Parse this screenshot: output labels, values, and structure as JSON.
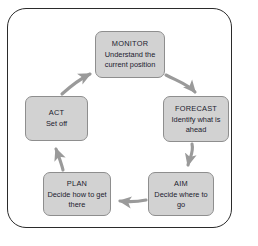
{
  "diagram": {
    "type": "cycle",
    "frame": {
      "visible": true,
      "border_color": "#2b2b2b"
    },
    "style": {
      "node_fill": "#d2d2d2",
      "node_border": "#8e8e8e",
      "text_color": "#1b1b2e",
      "arrow_color": "#9a9a9a",
      "background": "#ffffff"
    },
    "nodes": [
      {
        "id": "monitor",
        "title": "MONITOR",
        "desc": "Understand the current position"
      },
      {
        "id": "forecast",
        "title": "FORECAST",
        "desc": "Identify what is ahead"
      },
      {
        "id": "aim",
        "title": "AIM",
        "desc": "Decide where to go"
      },
      {
        "id": "plan",
        "title": "PLAN",
        "desc": "Decide how to get there"
      },
      {
        "id": "act",
        "title": "ACT",
        "desc": "Set off"
      }
    ],
    "edges": [
      {
        "id": "monitor-to-forecast",
        "from": "MONITOR",
        "to": "FORECAST",
        "shape": "curve-down-right"
      },
      {
        "id": "forecast-to-aim",
        "from": "FORECAST",
        "to": "AIM",
        "shape": "curve-down"
      },
      {
        "id": "aim-to-plan",
        "from": "AIM",
        "to": "PLAN",
        "shape": "straight-left"
      },
      {
        "id": "plan-to-act",
        "from": "PLAN",
        "to": "ACT",
        "shape": "straight-up"
      },
      {
        "id": "act-to-monitor",
        "from": "ACT",
        "to": "MONITOR",
        "shape": "curve-up-right"
      }
    ]
  }
}
